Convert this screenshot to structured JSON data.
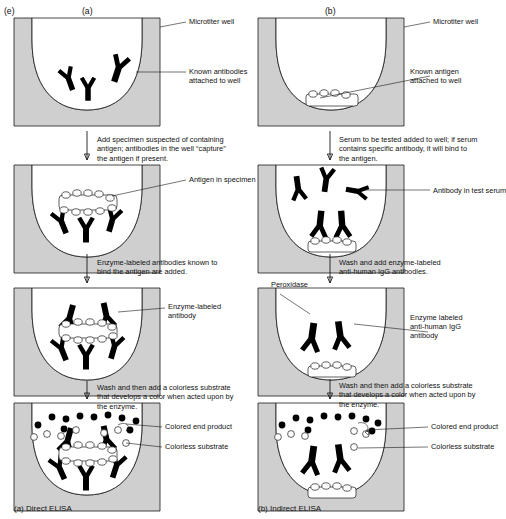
{
  "figure": {
    "index_tag": "(e)",
    "columns": [
      {
        "tag": "(a)",
        "caption": "(a) Direct ELISA"
      },
      {
        "tag": "(b)",
        "caption": "(b) Indirect ELISA"
      }
    ]
  },
  "left": {
    "labels": {
      "well": "Microtiter well",
      "known_antibodies": "Known antibodies\nattached to well",
      "antigen_in_specimen": "Antigen in specimen",
      "enzyme_labeled_antibody": "Enzyme-labeled\nantibody",
      "colored_end_product": "Colored end product",
      "colorless_substrate": "Colorless substrate"
    },
    "steps": [
      "Add specimen suspected of containing\nantigen; antibodies in the well “capture”\nthe antigen if present.",
      "Enzyme-labeled antibodies known to\nbind the antigen are added.",
      "Wash and then add a colorless substrate\nthat develops a color when acted upon by\nthe enzyme."
    ]
  },
  "right": {
    "labels": {
      "well": "Microtiter well",
      "known_antigen": "Known antigen\nattached to well",
      "antibody_in_test_serum": "Antibody in test serum",
      "peroxidase": "Peroxidase",
      "enzyme_labeled_anti_human": "Enzyme labeled\nanti-human IgG\nantibody",
      "colored_end_product": "Colored end product",
      "colorless_substrate": "Colorless substrate"
    },
    "steps": [
      "Serum to be tested added to well; if serum\ncontains specific antibody, it will bind to\nthe antigen.",
      "Wash and add enzyme-labeled\nanti-human IgG antibodies.",
      "Wash and then add a colorless substrate\nthat develops a color when acted upon by\nthe enzyme."
    ]
  },
  "colors": {
    "well_fill": "#cfcfcf",
    "well_interior": "#ffffff",
    "ink": "#1a1a1a",
    "antibody": "#000000"
  }
}
